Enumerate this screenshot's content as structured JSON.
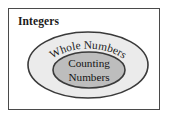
{
  "diagram": {
    "type": "nested-set-venn",
    "title": "Integers",
    "sets": [
      {
        "id": "integers",
        "label": "Integers",
        "shape": "rectangle",
        "level": 0,
        "fill": "#ffffff"
      },
      {
        "id": "whole-numbers",
        "label": "Whole Numbers",
        "shape": "ellipse",
        "level": 1,
        "fill": "#ebebeb"
      },
      {
        "id": "counting-numbers",
        "label_line1": "Counting",
        "label_line2": "Numbers",
        "label": "Counting Numbers",
        "shape": "ellipse",
        "level": 2,
        "fill": "#bdbdbd"
      }
    ],
    "colors": {
      "outline": "#3a3a3a",
      "frame_border": "#4a4a4a",
      "outer_ellipse_fill": "#ebebeb",
      "inner_ellipse_fill": "#bdbdbd",
      "text": "#1a1a1a",
      "background": "#ffffff"
    }
  }
}
